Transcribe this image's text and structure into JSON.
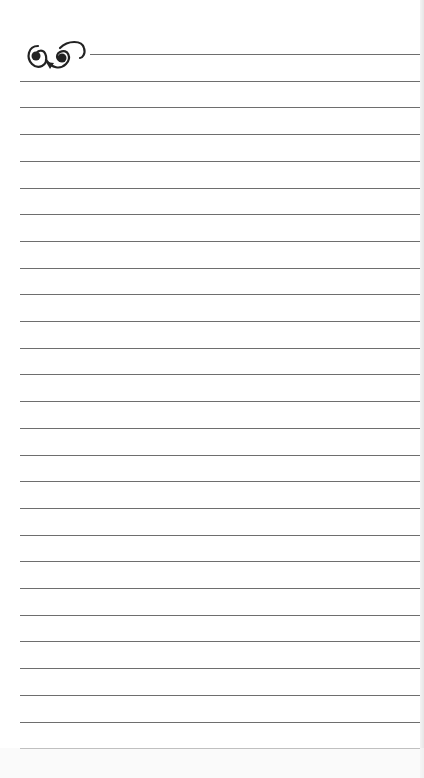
{
  "page": {
    "type": "lined-notebook-page",
    "ornament": "flourish-scroll-icon",
    "line_count": 27,
    "first_line_y": 54,
    "line_spacing": 26.7,
    "line_color": "#6e6e6e",
    "background": "#ffffff"
  }
}
